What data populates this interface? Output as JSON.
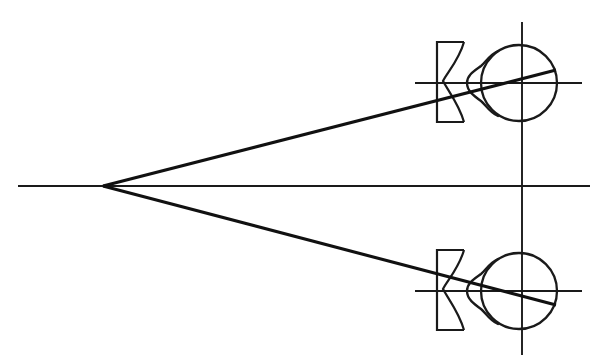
{
  "figure": {
    "title": "Optical ray diagram: point source imaged through diverging lenses into two eyes",
    "caption": "",
    "background_color": "#ffffff",
    "line_color": "#1a1a1a",
    "ray_color": "#111111",
    "width": 608,
    "height": 361
  },
  "chart_data": {
    "type": "diagram",
    "title": "Optical ray diagram: point source imaged through diverging lenses into two eyes",
    "xlabel": "",
    "ylabel": "",
    "xlim": [
      0,
      608
    ],
    "ylim": [
      0,
      361
    ],
    "grid": false,
    "legend": "none",
    "annotations": [],
    "elements": [
      {
        "name": "optical-axis-main",
        "kind": "line",
        "label": "central horizontal optical axis",
        "x1": 18,
        "y1": 186,
        "x2": 590,
        "y2": 186
      },
      {
        "name": "source-point",
        "kind": "point",
        "label": "point source / convergence vertex",
        "x": 103,
        "y": 186
      },
      {
        "name": "ray-upper",
        "kind": "line",
        "label": "upper ray from source to upper eye retina",
        "x1": 103,
        "y1": 186,
        "x2": 556,
        "y2": 70
      },
      {
        "name": "ray-lower",
        "kind": "line",
        "label": "lower ray from source to lower eye retina",
        "x1": 103,
        "y1": 186,
        "x2": 556,
        "y2": 305
      },
      {
        "name": "vertical-axis",
        "kind": "line",
        "label": "vertical reference axis through both eyes",
        "x1": 522,
        "y1": 22,
        "x2": 522,
        "y2": 355
      },
      {
        "name": "axis-upper-eye",
        "kind": "line",
        "label": "horizontal visual axis of upper eye",
        "x1": 415,
        "y1": 83,
        "x2": 582,
        "y2": 83
      },
      {
        "name": "axis-lower-eye",
        "kind": "line",
        "label": "horizontal visual axis of lower eye",
        "x1": 415,
        "y1": 291,
        "x2": 582,
        "y2": 291
      },
      {
        "name": "lens-upper",
        "kind": "diverging-lens",
        "label": "upper concave (diverging) spectacle lens",
        "left": 437,
        "right": 465,
        "top": 42,
        "bottom": 122
      },
      {
        "name": "lens-lower",
        "kind": "diverging-lens",
        "label": "lower concave (diverging) spectacle lens",
        "left": 437,
        "right": 465,
        "top": 250,
        "bottom": 330
      },
      {
        "name": "eye-upper",
        "kind": "eye",
        "label": "upper eyeball with cornea bulge",
        "cx": 519,
        "cy": 83,
        "r": 38
      },
      {
        "name": "eye-lower",
        "kind": "eye",
        "label": "lower eyeball with cornea bulge",
        "cx": 519,
        "cy": 291,
        "r": 38
      }
    ]
  }
}
